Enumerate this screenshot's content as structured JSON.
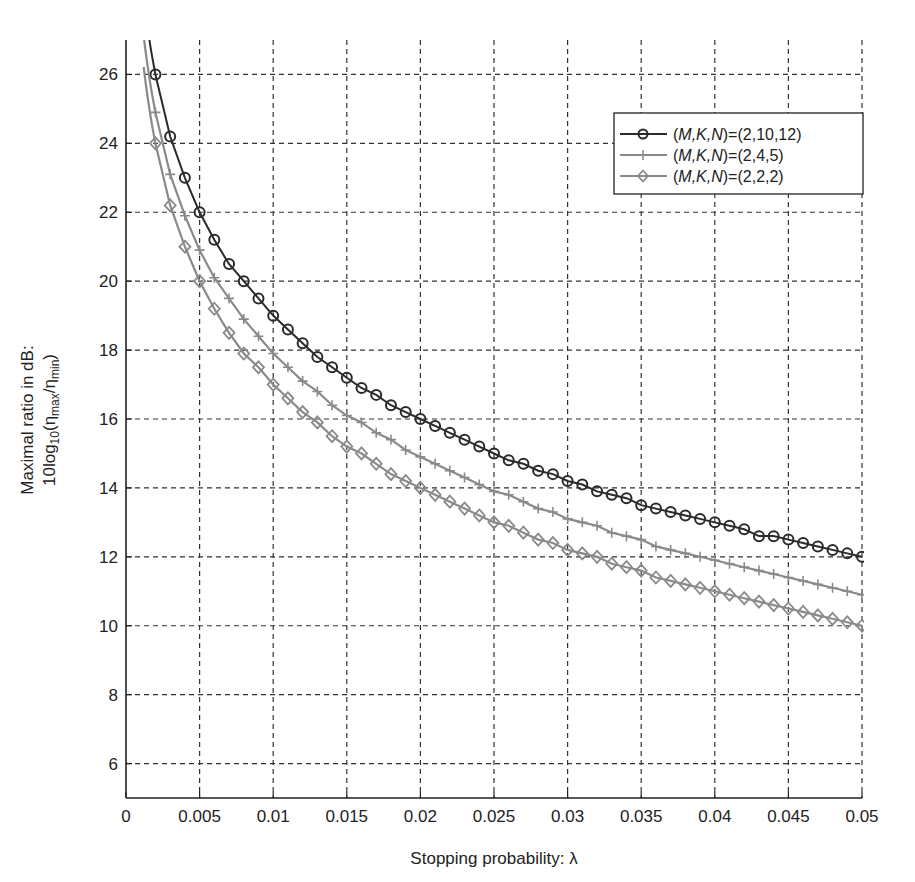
{
  "chart_data": {
    "type": "line",
    "title": "",
    "xlabel": "Stopping probability: λ",
    "ylabel_line1": "Maximal ratio in dB:",
    "ylabel_line2": "10log10(ηmax/ηmin)",
    "xlim": [
      0,
      0.05
    ],
    "ylim": [
      5,
      27
    ],
    "grid": true,
    "grid_style": "dashed",
    "legend_position": "upper right",
    "x_ticks": [
      0,
      0.005,
      0.01,
      0.015,
      0.02,
      0.025,
      0.03,
      0.035,
      0.04,
      0.045,
      0.05
    ],
    "x_tick_labels": [
      "0",
      "0.005",
      "0.01",
      "0.015",
      "0.02",
      "0.025",
      "0.03",
      "0.035",
      "0.04",
      "0.045",
      "0.05"
    ],
    "y_ticks": [
      6,
      8,
      10,
      12,
      14,
      16,
      18,
      20,
      22,
      24,
      26
    ],
    "y_tick_labels": [
      "6",
      "8",
      "10",
      "12",
      "14",
      "16",
      "18",
      "20",
      "22",
      "24",
      "26"
    ],
    "x": [
      0.002,
      0.003,
      0.004,
      0.005,
      0.006,
      0.007,
      0.008,
      0.009,
      0.01,
      0.011,
      0.012,
      0.013,
      0.014,
      0.015,
      0.016,
      0.017,
      0.018,
      0.019,
      0.02,
      0.021,
      0.022,
      0.023,
      0.024,
      0.025,
      0.026,
      0.027,
      0.028,
      0.029,
      0.03,
      0.031,
      0.032,
      0.033,
      0.034,
      0.035,
      0.036,
      0.037,
      0.038,
      0.039,
      0.04,
      0.041,
      0.042,
      0.043,
      0.044,
      0.045,
      0.046,
      0.047,
      0.048,
      0.049,
      0.05
    ],
    "series": [
      {
        "name": "(M,K,N)=(2,10,12)",
        "marker": "circle",
        "color": "#2a2a2a",
        "values": [
          26.0,
          24.2,
          23.0,
          22.0,
          21.2,
          20.5,
          20.0,
          19.5,
          19.0,
          18.6,
          18.2,
          17.8,
          17.5,
          17.2,
          16.9,
          16.7,
          16.4,
          16.2,
          16.0,
          15.8,
          15.6,
          15.4,
          15.2,
          15.0,
          14.8,
          14.7,
          14.5,
          14.4,
          14.2,
          14.1,
          13.9,
          13.8,
          13.7,
          13.5,
          13.4,
          13.3,
          13.2,
          13.1,
          13.0,
          12.9,
          12.8,
          12.6,
          12.6,
          12.5,
          12.4,
          12.3,
          12.2,
          12.1,
          12.0
        ]
      },
      {
        "name": "(M,K,N)=(2,4,5)",
        "marker": "plus",
        "color": "#8a8a8a",
        "values": [
          24.9,
          23.1,
          21.9,
          20.9,
          20.1,
          19.5,
          18.9,
          18.4,
          17.9,
          17.5,
          17.1,
          16.8,
          16.4,
          16.1,
          15.9,
          15.6,
          15.4,
          15.1,
          14.9,
          14.7,
          14.5,
          14.3,
          14.1,
          13.9,
          13.8,
          13.6,
          13.4,
          13.3,
          13.1,
          13.0,
          12.9,
          12.7,
          12.6,
          12.5,
          12.3,
          12.2,
          12.1,
          12.0,
          11.9,
          11.8,
          11.7,
          11.6,
          11.5,
          11.4,
          11.3,
          11.2,
          11.1,
          11.0,
          10.9
        ]
      },
      {
        "name": "(M,K,N)=(2,2,2)",
        "marker": "diamond",
        "color": "#8a8a8a",
        "values": [
          24.0,
          22.2,
          21.0,
          20.0,
          19.2,
          18.5,
          17.9,
          17.5,
          17.0,
          16.6,
          16.2,
          15.9,
          15.5,
          15.2,
          15.0,
          14.7,
          14.4,
          14.2,
          14.0,
          13.8,
          13.6,
          13.4,
          13.2,
          13.0,
          12.9,
          12.7,
          12.5,
          12.4,
          12.2,
          12.1,
          12.0,
          11.8,
          11.7,
          11.6,
          11.4,
          11.3,
          11.2,
          11.1,
          11.0,
          10.9,
          10.8,
          10.7,
          10.6,
          10.5,
          10.4,
          10.3,
          10.2,
          10.1,
          10.0
        ]
      }
    ]
  },
  "legend": {
    "items": [
      {
        "prefix": "(",
        "vars": "M,K,N",
        "suffix": ")=(2,10,12)"
      },
      {
        "prefix": "(",
        "vars": "M,K,N",
        "suffix": ")=(2,4,5)"
      },
      {
        "prefix": "(",
        "vars": "M,K,N",
        "suffix": ")=(2,2,2)"
      }
    ]
  },
  "axes": {
    "xlabel": "Stopping probability: λ",
    "ylabel_line1": "Maximal ratio in dB:",
    "ylabel_line2_base": "10log",
    "ylabel_line2_sub1": "10",
    "ylabel_line2_open": "(η",
    "ylabel_line2_sub2": "max",
    "ylabel_line2_mid": "/η",
    "ylabel_line2_sub3": "min",
    "ylabel_line2_close": ")"
  }
}
